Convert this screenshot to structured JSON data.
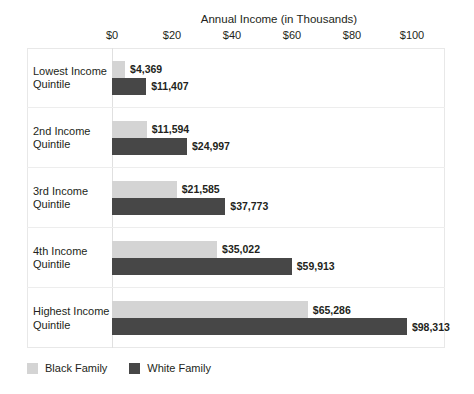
{
  "chart_data": {
    "type": "bar",
    "orientation": "horizontal",
    "title": "Annual Income (in Thousands)",
    "xlabel": "",
    "ylabel": "",
    "xlim": [
      0,
      110
    ],
    "tick_labels": [
      "$0",
      "$20",
      "$40",
      "$60",
      "$80",
      "$100"
    ],
    "tick_values": [
      0,
      20,
      40,
      60,
      80,
      100
    ],
    "grid": false,
    "legend_position": "bottom-left",
    "categories": [
      "Lowest Income Quintile",
      "2nd Income Quintile",
      "3rd Income Quintile",
      "4th Income Quintile",
      "Highest Income Quintile"
    ],
    "series": [
      {
        "name": "Black Family",
        "color": "#d4d4d4",
        "values": [
          4369,
          11594,
          21585,
          35022,
          65286
        ],
        "labels": [
          "$4,369",
          "$11,594",
          "$21,585",
          "$35,022",
          "$65,286"
        ]
      },
      {
        "name": "White Family",
        "color": "#474747",
        "values": [
          11407,
          24997,
          37773,
          59913,
          98313
        ],
        "labels": [
          "$11,407",
          "$24,997",
          "$37,773",
          "$59,913",
          "$98,313"
        ]
      }
    ]
  },
  "legend": {
    "items": [
      {
        "label": "Black Family",
        "swatch": "light"
      },
      {
        "label": "White Family",
        "swatch": "dark"
      }
    ]
  },
  "categories_two_line": [
    {
      "line1": "Lowest Income",
      "line2": "Quintile"
    },
    {
      "line1": "2nd Income",
      "line2": "Quintile"
    },
    {
      "line1": "3rd Income",
      "line2": "Quintile"
    },
    {
      "line1": "4th Income",
      "line2": "Quintile"
    },
    {
      "line1": "Highest Income",
      "line2": "Quintile"
    }
  ]
}
